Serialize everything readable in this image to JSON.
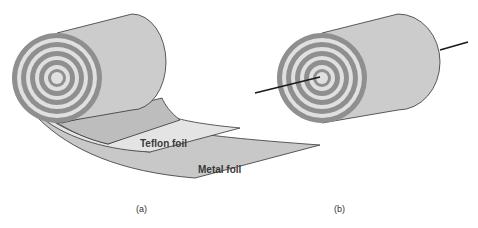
{
  "figure": {
    "panel_a": {
      "caption": "(a)",
      "labels": {
        "teflon": "Teflon foil",
        "metal": "Metal foil"
      }
    },
    "panel_b": {
      "caption": "(b)"
    }
  },
  "colors": {
    "roll_body": "#cccccc",
    "ring_dark": "#8f8f8f",
    "ring_light": "#e0e0e0",
    "outline": "#333333",
    "teflon_layer": "#e4e4e4",
    "metal_layer": "#c8c8c8",
    "under_layer": "#bdbdbd",
    "wire": "#1a1a1a"
  }
}
